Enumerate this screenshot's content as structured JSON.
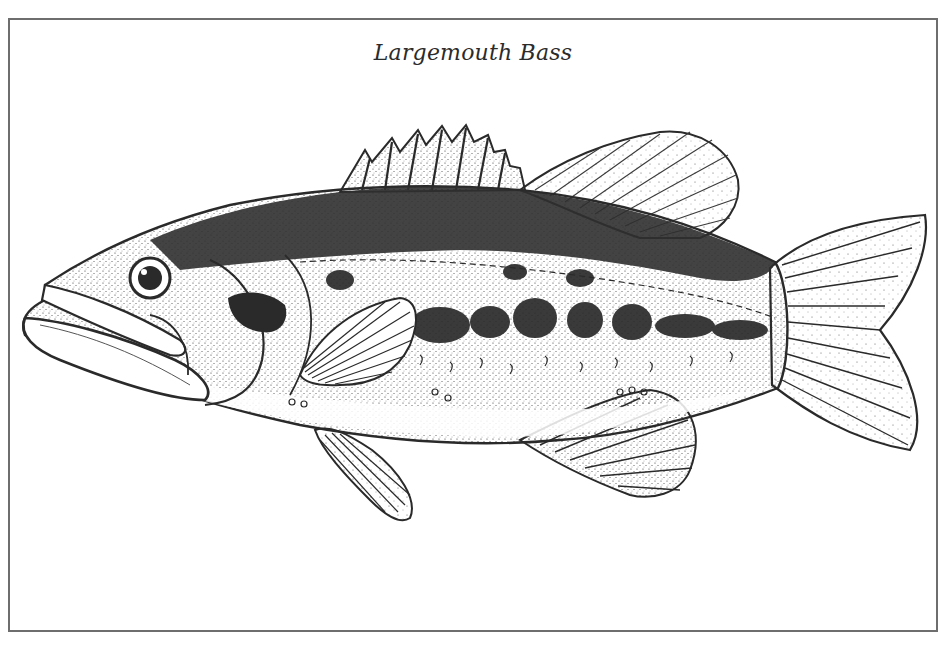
{
  "figure": {
    "caption": "Largemouth Bass",
    "style": "black-and-white stippled line drawing",
    "colors": {
      "ink": "#2a2a2a",
      "border": "#6e6e6e",
      "paper": "#ffffff"
    }
  }
}
